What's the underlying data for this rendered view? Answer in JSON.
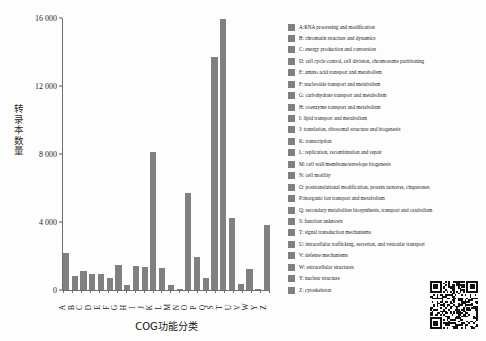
{
  "chart_data": {
    "type": "bar",
    "title": "",
    "xlabel": "COG功能分类",
    "ylabel": "转录本数量",
    "ylim": [
      0,
      16000
    ],
    "yticks": [
      0,
      4000,
      8000,
      12000,
      16000
    ],
    "ytick_labels": [
      "0",
      "4 000",
      "8 000",
      "12 000",
      "16 000"
    ],
    "grid": false,
    "legend_position": "right",
    "bar_color": "#808080",
    "categories": [
      "A",
      "B",
      "C",
      "D",
      "E",
      "F",
      "G",
      "H",
      "I",
      "J",
      "K",
      "L",
      "M",
      "N",
      "O",
      "P",
      "Q",
      "S",
      "T",
      "U",
      "V",
      "W",
      "Y",
      "Z"
    ],
    "values": [
      2150,
      800,
      1100,
      950,
      940,
      720,
      1500,
      280,
      1430,
      1330,
      8120,
      1320,
      290,
      40,
      5680,
      1960,
      720,
      13700,
      15960,
      4250,
      380,
      1220,
      30,
      3830
    ],
    "series": [
      {
        "name": "转录本数量",
        "values": [
          2150,
          800,
          1100,
          950,
          940,
          720,
          1500,
          280,
          1430,
          1330,
          8120,
          1320,
          290,
          40,
          5680,
          1960,
          720,
          13700,
          15960,
          4250,
          380,
          1220,
          30,
          3830
        ]
      }
    ],
    "legend": [
      "A:RNA processing and modification",
      "B: chromatin structure and dynamics",
      "C: energy production and conversion",
      "D: cell cycle control, cell division, chromosome partitioning",
      "E: amino acid transport and metabolism",
      "F: nucleotide transport and metabolism",
      "G: carbohydrate transport and metabolism",
      "H: coenzyme transport and metabolism",
      "I: lipid transport and metabolism",
      "J: translation, ribosomal structure and biogenesis",
      "K: transcription",
      "L: replication, recombination and repair",
      "M: cell wall/membrane/envelope biogenesis",
      "N: cell motility",
      "O: posttranslational modification, protein turnover, chaperones",
      "P:inorganic ion transport and metabolism",
      "Q: secondary metabolites biosynthesis, transport and catabolism",
      "S: function unknown",
      "T: signal transduction mechanisms",
      "U: intracellular trafficking, secretion, and vesicular transport",
      "V: defense mechanisms",
      "W: extracellular structures",
      "Y: nuclear structure",
      "Z: cytoskeleton"
    ]
  },
  "qr": {
    "name": "qr-code"
  }
}
